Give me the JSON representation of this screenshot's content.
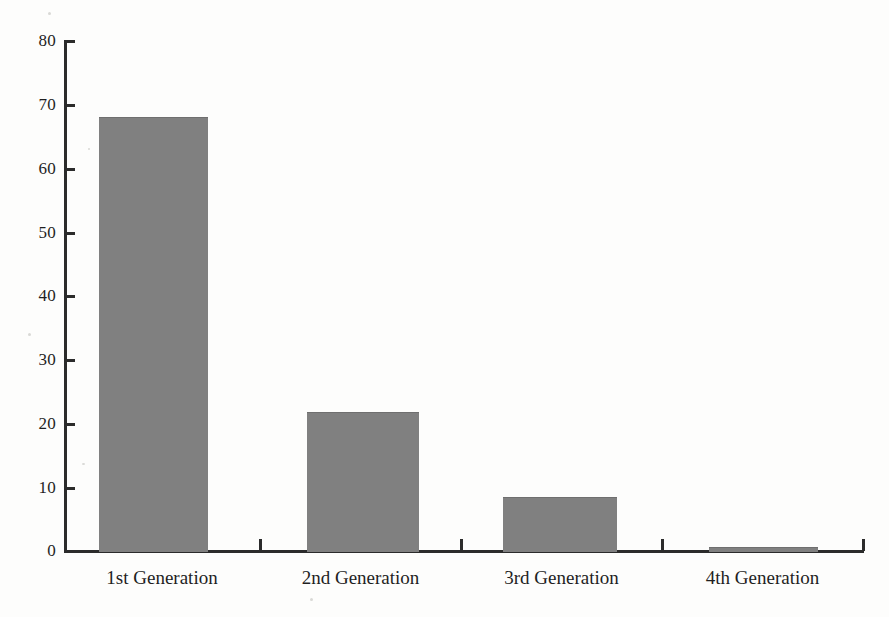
{
  "chart_data": {
    "type": "bar",
    "title": "",
    "subtitle": "",
    "xlabel": "",
    "ylabel": "",
    "categories": [
      "1st Generation",
      "2nd Generation",
      "3rd Generation",
      "4th Generation"
    ],
    "values": [
      68,
      21.8,
      8.5,
      0.6
    ],
    "series": [
      {
        "name": "",
        "values": [
          68,
          21.8,
          8.5,
          0.6
        ]
      }
    ],
    "ylim": [
      0,
      80
    ],
    "ytick_labels": [
      "0",
      "10",
      "20",
      "30",
      "40",
      "50",
      "60",
      "70",
      "80"
    ],
    "ytick_values": [
      0,
      10,
      20,
      30,
      40,
      50,
      60,
      70,
      80
    ],
    "grid": false,
    "legend": false,
    "legend_position": "none",
    "bar_color": "#808080",
    "axis_color": "#2b2b2b",
    "background_color": "#fdfdfc"
  }
}
